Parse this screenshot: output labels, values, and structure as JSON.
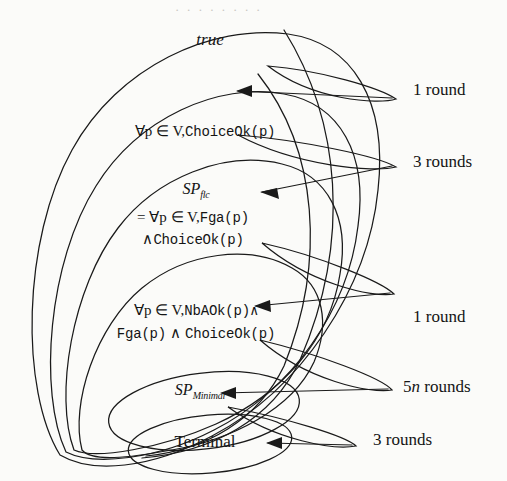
{
  "figure": {
    "type": "nested-set-convergence-diagram",
    "title": "",
    "background_color": "#fbfbf9",
    "stroke_color": "#1a1a1a",
    "levels": [
      {
        "id": "level-1",
        "set_label": "true",
        "set_label_style": "italic",
        "transition_label": "1 round"
      },
      {
        "id": "level-2",
        "set_label_parts": {
          "quantifier": "∀p ∈ V,",
          "predicate": "ChoiceOk(p)"
        },
        "transition_label": "3 rounds"
      },
      {
        "id": "level-3",
        "set_name": "SP",
        "set_name_sub": "flc",
        "definition_line1_quantifier": "= ∀p ∈ V,",
        "definition_line1_predicate": "Fga(p)",
        "definition_line2_conn": "∧",
        "definition_line2_predicate": "ChoiceOk(p)",
        "transition_label": "1 round"
      },
      {
        "id": "level-4",
        "line1_quantifier": "∀p ∈ V,",
        "line1_predicate": "NbAOk(p)∧",
        "line2_predicate_a": "Fga(p)",
        "line2_conn": "∧",
        "line2_predicate_b": "ChoiceOk(p)",
        "transition_label": "5n rounds"
      },
      {
        "id": "level-5",
        "set_name": "SP",
        "set_name_sub": "Minimal",
        "transition_label": "3 rounds"
      },
      {
        "id": "level-6",
        "set_label": "Terminal",
        "transition_label": ""
      }
    ],
    "round_labels": [
      {
        "id": "rl-1",
        "text_prefix": "1",
        "text_suffix": " round"
      },
      {
        "id": "rl-2",
        "text_prefix": "3",
        "text_suffix": " rounds"
      },
      {
        "id": "rl-3",
        "text_prefix": "1",
        "text_suffix": " round"
      },
      {
        "id": "rl-4",
        "text_prefix": "5",
        "text_italic": "n",
        "text_suffix": " rounds"
      },
      {
        "id": "rl-5",
        "text_prefix": "3",
        "text_suffix": " rounds"
      }
    ],
    "scan_bleed_text": "· · ·  · ·  · · ·"
  }
}
